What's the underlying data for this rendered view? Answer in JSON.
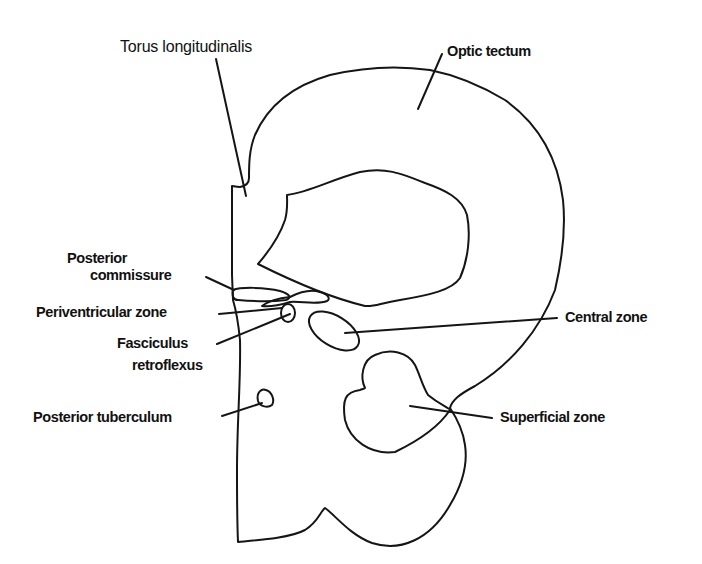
{
  "figure": {
    "type": "anatomical line diagram"
  },
  "labels": {
    "torus_longitudinalis": "Torus longitudinalis",
    "optic_tectum": "Optic tectum",
    "posterior_commissure_line1": "Posterior",
    "posterior_commissure_line2": "commissure",
    "periventricular_zone": "Periventricular zone",
    "fasciculus_retroflexus_line1": "Fasciculus",
    "fasciculus_retroflexus_line2": "retroflexus",
    "posterior_tuberculum": "Posterior tuberculum",
    "central_zone": "Central zone",
    "superficial_zone": "Superficial zone"
  },
  "colors": {
    "stroke": "#151515",
    "text": "#111111",
    "background": "#ffffff"
  }
}
